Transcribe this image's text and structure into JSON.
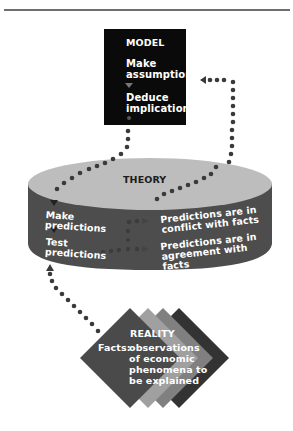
{
  "diagram": {
    "type": "flow",
    "colors": {
      "model_box": "#0a0a0a",
      "cylinder_top": "#bdbdbd",
      "cylinder_body": "#4d4d4d",
      "dots": "#3a3a3a",
      "diamond_front": "#4a4a4a",
      "diamond_mid_light": "#a0a0a0",
      "diamond_mid": "#808080",
      "diamond_back": "#333333",
      "text_light": "#ffffff",
      "text_dark": "#1c1c1c"
    },
    "model": {
      "title": "MODEL",
      "steps": [
        "Make assumptions",
        "Deduce implications"
      ],
      "step_icons": [
        "down-arrow-icon",
        "dot-icon"
      ]
    },
    "theory": {
      "title": "THEORY",
      "left_steps": [
        "Make predictions",
        "Test predictions"
      ],
      "outcomes": [
        "Predictions are in conflict with facts",
        "Predictions are in agreement with facts"
      ]
    },
    "reality": {
      "title": "REALITY",
      "facts_label": "Facts:",
      "facts_lines": [
        "observations",
        "of economic",
        "phenomena to",
        "be explained"
      ]
    },
    "connections": [
      {
        "from": "model.deduce_implications",
        "to": "theory.make_predictions",
        "style": "dotted-arrow"
      },
      {
        "from": "theory.conflict",
        "to": "model.make_assumptions",
        "style": "dotted-arrow"
      },
      {
        "from": "reality.facts",
        "to": "theory.test_predictions",
        "style": "dotted-arrow"
      },
      {
        "from": "theory.test_predictions",
        "to": "theory.agreement",
        "style": "dotted-arrow"
      },
      {
        "from": "theory.make_predictions",
        "to": "theory.conflict",
        "style": "dotted-arrow"
      }
    ]
  }
}
